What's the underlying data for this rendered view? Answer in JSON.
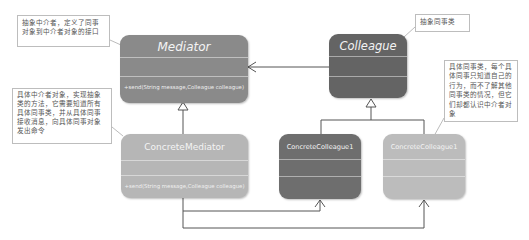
{
  "diagram": {
    "type": "UML class diagram - Mediator pattern",
    "classes": {
      "mediator": {
        "name": "Mediator",
        "operation": "+send(String message,Colleague colleague)",
        "color": "#8a8a8a"
      },
      "colleague": {
        "name": "Colleague",
        "operation": "",
        "color": "#646464"
      },
      "concrete_mediator": {
        "name": "ConcreteMediator",
        "operation": "+send(String message,Colleague colleague)",
        "color": "#b6b6b6"
      },
      "concrete_colleague_a": {
        "name": "ConcreteColleague1",
        "operation": "",
        "color": "#6e6e6e"
      },
      "concrete_colleague_b": {
        "name": "ConcreteColleague1",
        "operation": "",
        "color": "#bcbcbc"
      }
    },
    "notes": {
      "mediator_note": "抽象中介者，定义了同事对象到中介者对象的接口",
      "colleague_note": "抽象同事类",
      "concrete_mediator_note": "具体中介者对象，实现抽象类的方法，它需要知道所有具体同事类，并从具体同事接收消息，向具体同事对象发出命令",
      "concrete_colleague_note": "具体同事类，每个具体同事只知道自己的行为，而不了解其他同事类的情况，但它们却都认识中介者对象"
    },
    "colors": {
      "line": "#555555",
      "note_border": "#bdbdbd"
    }
  }
}
